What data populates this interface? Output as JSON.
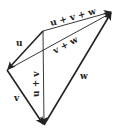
{
  "diagram": {
    "type": "vector-addition",
    "colors": {
      "stroke": "#222222",
      "background": "#ffffff"
    },
    "points": {
      "A": [
        43,
        31
      ],
      "B": [
        7,
        70
      ],
      "C": [
        44,
        125
      ],
      "D": [
        112,
        12
      ]
    },
    "vectors": [
      {
        "id": "u",
        "label": "u",
        "from": "A",
        "to": "B"
      },
      {
        "id": "v",
        "label": "v",
        "from": "B",
        "to": "C"
      },
      {
        "id": "w",
        "label": "w",
        "from": "C",
        "to": "D"
      },
      {
        "id": "u_plus_v",
        "label": "u + v",
        "from": "A",
        "to": "C"
      },
      {
        "id": "v_plus_w",
        "label": "v + w",
        "from": "B",
        "to": "D"
      },
      {
        "id": "u_plus_v_plus_w",
        "label": "u + v + w",
        "from": "A",
        "to": "D"
      }
    ]
  }
}
